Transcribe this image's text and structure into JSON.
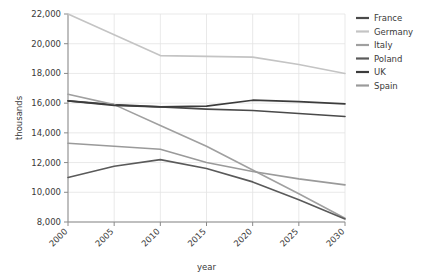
{
  "chart_data": {
    "type": "line",
    "title": "",
    "xlabel": "year",
    "ylabel": "thousands",
    "x": [
      2000,
      2005,
      2010,
      2015,
      2020,
      2025,
      2030
    ],
    "xticklabels": [
      "2000",
      "2005",
      "2010",
      "2015",
      "2020",
      "2025",
      "2030"
    ],
    "yticklabels": [
      "8,000",
      "10,000",
      "12,000",
      "14,000",
      "16,000",
      "18,000",
      "20,000",
      "22,000"
    ],
    "ytickvalues": [
      8000,
      10000,
      12000,
      14000,
      16000,
      18000,
      20000,
      22000
    ],
    "xlim": [
      2000,
      2030
    ],
    "ylim": [
      8000,
      22000
    ],
    "grid": true,
    "legend_position": "right",
    "series": [
      {
        "name": "France",
        "color": "#4a4a4a",
        "values": [
          16150,
          15900,
          15750,
          15600,
          15500,
          15300,
          15100
        ]
      },
      {
        "name": "Germany",
        "color": "#c4c4c4",
        "values": [
          22000,
          20600,
          19200,
          19150,
          19100,
          18600,
          18000
        ]
      },
      {
        "name": "Italy",
        "color": "#a0a0a0",
        "values": [
          16600,
          15900,
          14500,
          13100,
          11500,
          9900,
          8250
        ]
      },
      {
        "name": "Poland",
        "color": "#5a5a5a",
        "values": [
          11000,
          11750,
          12200,
          11600,
          10700,
          9500,
          8200
        ]
      },
      {
        "name": "UK",
        "color": "#3c3c3c",
        "values": [
          16150,
          15850,
          15750,
          15800,
          16200,
          16100,
          15950
        ]
      },
      {
        "name": "Spain",
        "color": "#9a9a9a",
        "values": [
          13300,
          13100,
          12900,
          12000,
          11400,
          10900,
          10500
        ]
      }
    ]
  },
  "legend": {
    "items": [
      {
        "label": "France"
      },
      {
        "label": "Germany"
      },
      {
        "label": "Italy"
      },
      {
        "label": "Poland"
      },
      {
        "label": "UK"
      },
      {
        "label": "Spain"
      }
    ]
  }
}
